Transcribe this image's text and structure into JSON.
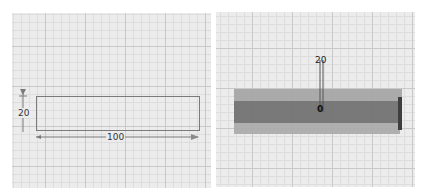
{
  "viewports": {
    "sketch": {
      "label": "2D sketch view",
      "rectangle": {
        "width": 100,
        "height": 20
      },
      "dimensions": {
        "height_label": "20",
        "width_label": "100"
      }
    },
    "model": {
      "label": "3D model view",
      "extrude_dimension_label": "20",
      "handle_label": "0"
    }
  },
  "colors": {
    "grid_bg": "#ececec",
    "grid_major": "#c9c9c9",
    "grid_minor": "#dddddd",
    "sketch_line": "#7a7a7a",
    "solid_top": "#9c9c9c",
    "solid_front": "#6e6e6e",
    "solid_bottom": "#a8a8a8"
  }
}
